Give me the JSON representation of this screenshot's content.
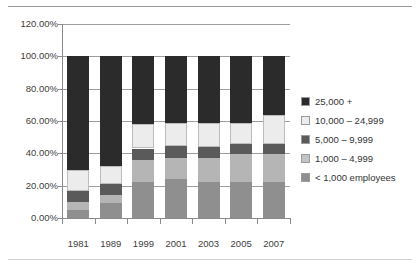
{
  "chart_data": {
    "type": "bar",
    "stacked": true,
    "title": "",
    "subtitle": "",
    "xlabel": "",
    "ylabel": "",
    "categories": [
      "1981",
      "1989",
      "1999",
      "2001",
      "2003",
      "2005",
      "2007"
    ],
    "ylim": [
      0,
      120
    ],
    "ytick_labels": [
      "0.00%",
      "20.00%",
      "40.00%",
      "60.00%",
      "80.00%",
      "100.00%",
      "120.00%"
    ],
    "ytick_values": [
      0,
      20,
      40,
      60,
      80,
      100,
      120
    ],
    "ytick_format": "percent",
    "grid": true,
    "grid_axis": "y",
    "legend_position": "right",
    "stack_order": "bottom-to-top",
    "series": [
      {
        "name": "< 1,000 employees",
        "color": "#8f8f8f",
        "values": [
          5.0,
          9.5,
          22.0,
          24.0,
          22.0,
          22.0,
          22.5
        ]
      },
      {
        "name": "1,000 – 4,999",
        "color": "#b5b5b5",
        "values": [
          5.0,
          5.0,
          14.0,
          13.0,
          15.0,
          17.5,
          17.0
        ]
      },
      {
        "name": "5,000 – 9,999",
        "color": "#5a5a5a",
        "values": [
          7.0,
          6.5,
          7.0,
          7.5,
          7.0,
          6.0,
          6.5
        ]
      },
      {
        "name": "10,000 – 24,999",
        "color": "#ececec",
        "values": [
          13.0,
          11.0,
          15.0,
          14.5,
          15.0,
          13.5,
          18.0
        ]
      },
      {
        "name": "25,000 +",
        "color": "#2b2b2b",
        "values": [
          70.0,
          68.0,
          42.0,
          41.0,
          41.0,
          41.0,
          36.0
        ]
      }
    ]
  },
  "legend": {
    "items": [
      {
        "label": "25,000 +",
        "color": "#2b2b2b"
      },
      {
        "label": "10,000 – 24,999",
        "color": "#ececec"
      },
      {
        "label": "5,000 – 9,999",
        "color": "#5a5a5a"
      },
      {
        "label": "1,000 – 4,999",
        "color": "#c3c3c3"
      },
      {
        "label": "< 1,000 employees",
        "color": "#8f8f8f"
      }
    ]
  },
  "colors": {
    "axis": "#8a8a8a",
    "gridline": "#9d9d9d",
    "text": "#404040",
    "background": "#ffffff",
    "rule": "#9a9a9a"
  }
}
